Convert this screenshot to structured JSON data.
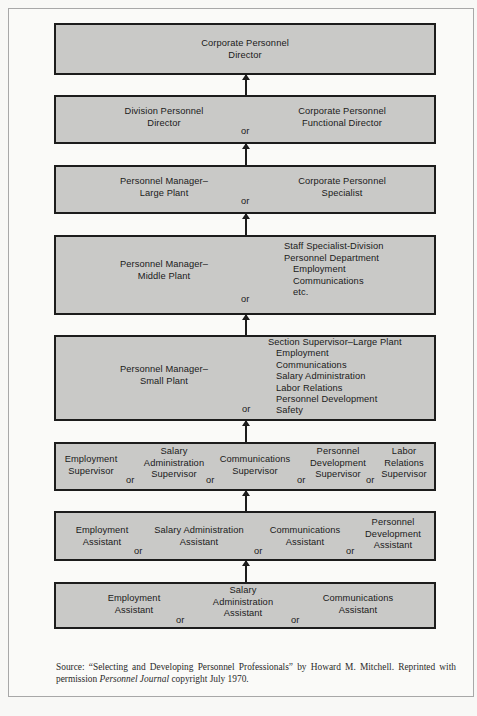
{
  "diagram": {
    "type": "career-ladder",
    "levels": [
      {
        "id": 1,
        "positions": [
          "Corporate Personnel Director"
        ]
      },
      {
        "id": 2,
        "positions": [
          "Division Personnel Director",
          "Corporate Personnel Functional Director"
        ],
        "connector": "or"
      },
      {
        "id": 3,
        "positions": [
          "Personnel Manager–Large Plant",
          "Corporate Personnel Specialist"
        ],
        "connector": "or"
      },
      {
        "id": 4,
        "positions": [
          "Personnel Manager–Middle Plant",
          "Staff Specialist-Division Personnel Department"
        ],
        "sub_items": [
          "Employment",
          "Communications",
          "etc."
        ],
        "connector": "or"
      },
      {
        "id": 5,
        "positions": [
          "Personnel Manager–Small Plant",
          "Section Supervisor–Large Plant"
        ],
        "sub_items": [
          "Employment",
          "Communications",
          "Salary Administration",
          "Labor Relations",
          "Personnel Development",
          "Safety"
        ],
        "connector": "or"
      },
      {
        "id": 6,
        "positions": [
          "Employment Supervisor",
          "Salary Administration Supervisor",
          "Communications Supervisor",
          "Personnel Development Supervisor",
          "Labor Relations Supervisor"
        ],
        "connector": "or"
      },
      {
        "id": 7,
        "positions": [
          "Employment Assistant",
          "Salary Administration Assistant",
          "Communications Assistant",
          "Personnel Development Assistant"
        ],
        "connector": "or"
      },
      {
        "id": 8,
        "positions": [
          "Employment Assistant",
          "Salary Administration Assistant",
          "Communications Assistant"
        ],
        "connector": "or"
      }
    ]
  },
  "labels": {
    "or": "or",
    "l1": {
      "a1": "Corporate Personnel",
      "a2": "Director"
    },
    "l2": {
      "a1": "Division Personnel",
      "a2": "Director",
      "b1": "Corporate Personnel",
      "b2": "Functional Director"
    },
    "l3": {
      "a1": "Personnel Manager–",
      "a2": "Large Plant",
      "b1": "Corporate Personnel",
      "b2": "Specialist"
    },
    "l4": {
      "a1": "Personnel Manager–",
      "a2": "Middle Plant",
      "b1": "Staff Specialist-Division",
      "b2": "Personnel Department",
      "s1": "Employment",
      "s2": "Communications",
      "s3": "etc."
    },
    "l5": {
      "a1": "Personnel Manager–",
      "a2": "Small Plant",
      "b1": "Section Supervisor–Large Plant",
      "s1": "Employment",
      "s2": "Communications",
      "s3": "Salary Administration",
      "s4": "Labor Relations",
      "s5": "Personnel Development",
      "s6": "Safety"
    },
    "l6": {
      "a1": "Employment",
      "a2": "Supervisor",
      "b1": "Salary",
      "b2": "Administration",
      "b3": "Supervisor",
      "c1": "Communications",
      "c2": "Supervisor",
      "d1": "Personnel",
      "d2": "Development",
      "d3": "Supervisor",
      "e1": "Labor",
      "e2": "Relations",
      "e3": "Supervisor"
    },
    "l7": {
      "a1": "Employment",
      "a2": "Assistant",
      "b1": "Salary Administration",
      "b2": "Assistant",
      "c1": "Communications",
      "c2": "Assistant",
      "d1": "Personnel",
      "d2": "Development",
      "d3": "Assistant"
    },
    "l8": {
      "a1": "Employment",
      "a2": "Assistant",
      "b1": "Salary",
      "b2": "Administration",
      "b3": "Assistant",
      "c1": "Communications",
      "c2": "Assistant"
    }
  },
  "source": {
    "prefix": "Source: “Selecting and Developing Personnel Professionals” by Howard M. Mitchell. Reprinted with permission ",
    "journal": "Personnel Journal",
    "suffix": " copyright July 1970."
  },
  "colors": {
    "box_fill": "#c9c9c7",
    "box_border": "#1c1c1c",
    "background": "#f8f8f6",
    "frame_border": "#a8a8a8"
  }
}
